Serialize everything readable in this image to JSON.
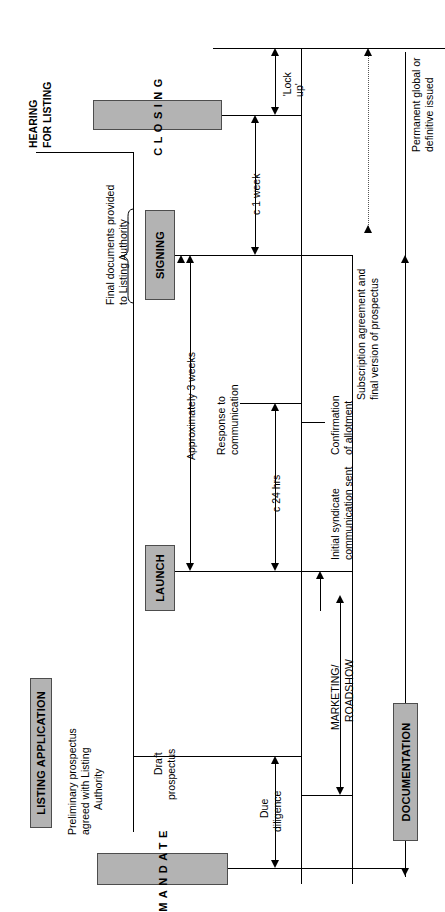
{
  "diagram": {
    "orientation": "rotated-90",
    "palette": {
      "stage_fill": "#b3b3b3",
      "stage_border": "#4d4d4d",
      "line": "#000000",
      "dotted_line": "#555555",
      "background": "#ffffff"
    }
  },
  "stages": [
    {
      "id": "closing",
      "label": "CLOSING",
      "letter_spaced": true
    },
    {
      "id": "signing",
      "label": "SIGNING",
      "letter_spaced": false
    },
    {
      "id": "launch",
      "label": "LAUNCH",
      "letter_spaced": false
    },
    {
      "id": "mandate",
      "label": "MANDATE",
      "letter_spaced": true
    }
  ],
  "workstreams": [
    {
      "id": "listing-application",
      "label": "LISTING APPLICATION"
    },
    {
      "id": "documentation",
      "label": "DOCUMENTATION"
    }
  ],
  "milestones": [
    {
      "id": "hearing-for-listing",
      "line1": "HEARING",
      "line2": "FOR LISTING"
    }
  ],
  "annotations": [
    {
      "id": "final-documents",
      "line1": "Final documents provided",
      "line2": "to Listing Authority"
    },
    {
      "id": "preliminary-prospectus",
      "line1": "Preliminary prospectus",
      "line2": "agreed with Listing",
      "line3": "Authority"
    },
    {
      "id": "draft-prospectus",
      "line1": "Draft",
      "line2": "prospectus"
    },
    {
      "id": "response-to-communication",
      "line1": "Response to",
      "line2": "communication"
    },
    {
      "id": "confirmation-of-allotment",
      "line1": "Confirmation",
      "line2": "of allotment"
    },
    {
      "id": "initial-syndicate",
      "line1": "Initial syndicate",
      "line2": "communication sent"
    },
    {
      "id": "subscription-agreement",
      "line1": "Subscription agreement and",
      "line2": "final version of prospectus"
    },
    {
      "id": "permanent-global",
      "line1": "Permanent global or",
      "line2": "definitive issued"
    }
  ],
  "durations": [
    {
      "id": "lock-up",
      "label": "'Lock\nup'",
      "line1": "'Lock",
      "line2": "up'"
    },
    {
      "id": "c-1-week",
      "label": "c 1 week",
      "line1": "c 1 week"
    },
    {
      "id": "approximately-3-weeks",
      "label": "Approximately 3 weeks",
      "line1": "Approximately 3 weeks"
    },
    {
      "id": "c-24-hrs",
      "label": "c 24 hrs",
      "line1": "c 24 hrs"
    },
    {
      "id": "due-diligence",
      "label": "Due diligence",
      "line1": "Due",
      "line2": "diligence"
    },
    {
      "id": "marketing-roadshow",
      "label": "MARKETING/ ROADSHOW",
      "line1": "MARKETING/",
      "line2": "ROADSHOW"
    }
  ]
}
